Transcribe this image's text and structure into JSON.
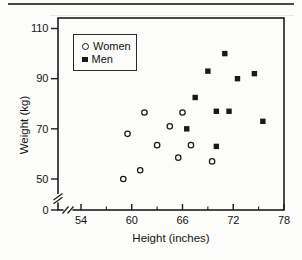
{
  "chart_data": {
    "type": "scatter",
    "title": "",
    "xlabel": "Height (inches)",
    "ylabel": "Weight (kg)",
    "x_major_ticks": [
      54,
      60,
      66,
      72,
      78
    ],
    "x_minor_ticks": [
      57,
      63,
      69,
      75
    ],
    "y_major_ticks": [
      110,
      90,
      70,
      50,
      0
    ],
    "xlim_shown": [
      54,
      78
    ],
    "ylim_shown": [
      50,
      110
    ],
    "axis_breaks": {
      "x": true,
      "y": true
    },
    "grid": false,
    "legend": {
      "position": "top-left",
      "entries": [
        {
          "label": "Women",
          "marker": "open-circle"
        },
        {
          "label": "Men",
          "marker": "filled-square"
        }
      ]
    },
    "series": [
      {
        "name": "Women",
        "marker": "open-circle",
        "points": [
          [
            59,
            50
          ],
          [
            59.5,
            68
          ],
          [
            61,
            53.5
          ],
          [
            61.5,
            76.5
          ],
          [
            63,
            63.5
          ],
          [
            64.5,
            71
          ],
          [
            65.5,
            58.5
          ],
          [
            66,
            76.5
          ],
          [
            67,
            63.5
          ],
          [
            69.5,
            57
          ]
        ]
      },
      {
        "name": "Men",
        "marker": "filled-square",
        "points": [
          [
            66.5,
            70
          ],
          [
            67.5,
            82.5
          ],
          [
            69,
            93
          ],
          [
            70,
            63
          ],
          [
            70,
            77
          ],
          [
            71,
            100
          ],
          [
            71.5,
            77
          ],
          [
            72.5,
            90
          ],
          [
            74.5,
            92
          ],
          [
            75.5,
            73
          ]
        ]
      }
    ],
    "colors": {
      "marker": "#1a1a1a",
      "background": "#fcfcfa",
      "frame": "#1c1c1c"
    }
  }
}
